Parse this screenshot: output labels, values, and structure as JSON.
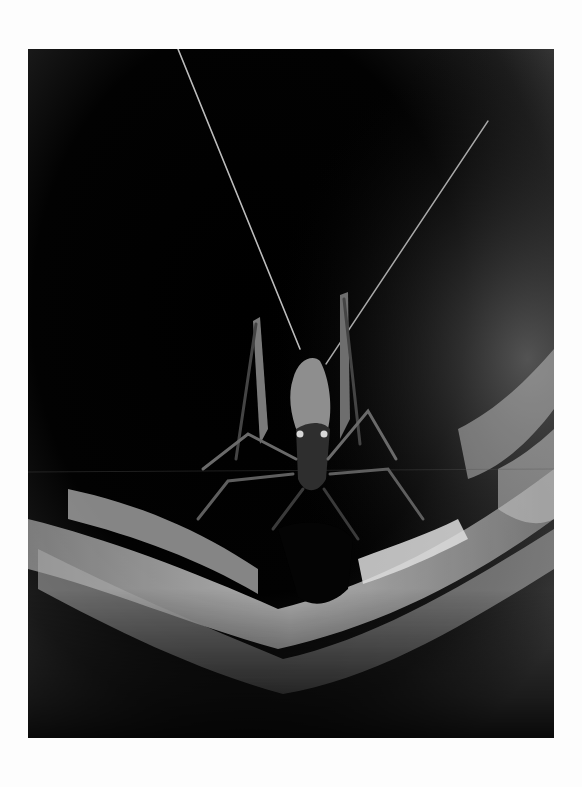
{
  "image": {
    "subject": "cave cricket in dark tunnel",
    "alt": "Grayscale photograph of a cave cricket with long antennae facing the camera inside a dark, curved rock tunnel with pale banded stone below",
    "palette": {
      "page_background": "#fdfdfd",
      "photo_dark": "#000000",
      "rock_light": "#d8d8d8",
      "rock_mid": "#6a6a6a",
      "vignette_gray": "#4a4a4a"
    }
  }
}
